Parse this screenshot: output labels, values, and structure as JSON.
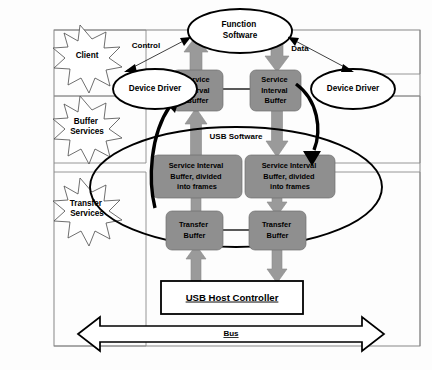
{
  "diagram": {
    "colors": {
      "buffer_fill": "#8f8f8f",
      "arrow_grey": "#9a9a9a",
      "outline": "#000000",
      "frame": "#7a7a7a",
      "background": "#ffffff"
    },
    "layer_labels": [
      {
        "id": "client",
        "text": "Client"
      },
      {
        "id": "buffer-services",
        "text": "Buffer\nServices"
      },
      {
        "id": "transfer-services",
        "text": "Transfer\nServices"
      }
    ],
    "layer_label_lines": {
      "client": [
        "Client"
      ],
      "buffer_services": [
        "Buffer",
        "Services"
      ],
      "transfer_services": [
        "Transfer",
        "Services"
      ]
    },
    "ellipses": {
      "function_software": [
        "Function",
        "Software"
      ],
      "device_driver_left": [
        "Device Driver"
      ],
      "device_driver_right": [
        "Device Driver"
      ],
      "usb_software": "USB Software"
    },
    "buffers": {
      "service_interval_left": [
        "Service",
        "Interval",
        "Buffer"
      ],
      "service_interval_right": [
        "Service",
        "Interval",
        "Buffer"
      ],
      "service_interval_frames_left": [
        "Service Interval",
        "Buffer, divided",
        "into frames"
      ],
      "service_interval_frames_right": [
        "Service Interval",
        "Buffer, divided",
        "into frames"
      ],
      "transfer_buffer_left": [
        "Transfer",
        "Buffer"
      ],
      "transfer_buffer_right": [
        "Transfer",
        "Buffer"
      ]
    },
    "flow_labels": {
      "control": "Control",
      "data": "Data"
    },
    "host_controller": "USB Host Controller",
    "bus": "Bus"
  }
}
